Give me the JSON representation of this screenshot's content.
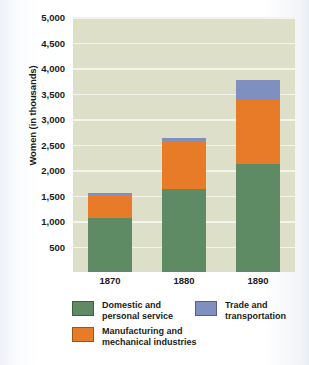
{
  "chart_data": {
    "type": "bar",
    "stacked": true,
    "title": "",
    "xlabel": "",
    "ylabel": "Women (in thousands)",
    "categories": [
      "1870",
      "1880",
      "1890"
    ],
    "ylim": [
      0,
      5000
    ],
    "ytick_step": 500,
    "ytick_labels": [
      "5,000",
      "4,500",
      "4,000",
      "3,500",
      "3,000",
      "2,500",
      "2,000",
      "1,500",
      "1,000",
      "500"
    ],
    "ytick_values": [
      5000,
      4500,
      4000,
      3500,
      3000,
      2500,
      2000,
      1500,
      1000,
      500
    ],
    "grid": true,
    "legend_position": "bottom",
    "series": [
      {
        "name": "Domestic and\npersonal service",
        "color": "#5f8b64",
        "values": [
          1060,
          1630,
          2120
        ]
      },
      {
        "name": "Manufacturing and\nmechanical industries",
        "color": "#e87b28",
        "values": [
          450,
          940,
          1260
        ]
      },
      {
        "name": "Trade and\ntransportation",
        "color": "#7e8fc0",
        "values": [
          40,
          60,
          380
        ]
      }
    ],
    "totals": [
      1550,
      2630,
      3760
    ],
    "plot_background": "#dedfc8",
    "gridline_color": "#f4f4ec"
  },
  "axis": {
    "y_title": "Women (in thousands)",
    "y_ticks": [
      {
        "label": "5,000",
        "value": 5000
      },
      {
        "label": "4,500",
        "value": 4500
      },
      {
        "label": "4,000",
        "value": 4000
      },
      {
        "label": "3,500",
        "value": 3500
      },
      {
        "label": "3,000",
        "value": 3000
      },
      {
        "label": "2,500",
        "value": 2500
      },
      {
        "label": "2,000",
        "value": 2000
      },
      {
        "label": "1,500",
        "value": 1500
      },
      {
        "label": "1,000",
        "value": 1000
      },
      {
        "label": "500",
        "value": 500
      }
    ],
    "x_ticks": [
      {
        "label": "1870"
      },
      {
        "label": "1880"
      },
      {
        "label": "1890"
      }
    ]
  },
  "legend": {
    "items": [
      {
        "label": "Domestic and\npersonal service",
        "color": "#5f8b64"
      },
      {
        "label": "Manufacturing and\nmechanical industries",
        "color": "#e87b28"
      },
      {
        "label": "Trade and\ntransportation",
        "color": "#7e8fc0"
      }
    ]
  }
}
